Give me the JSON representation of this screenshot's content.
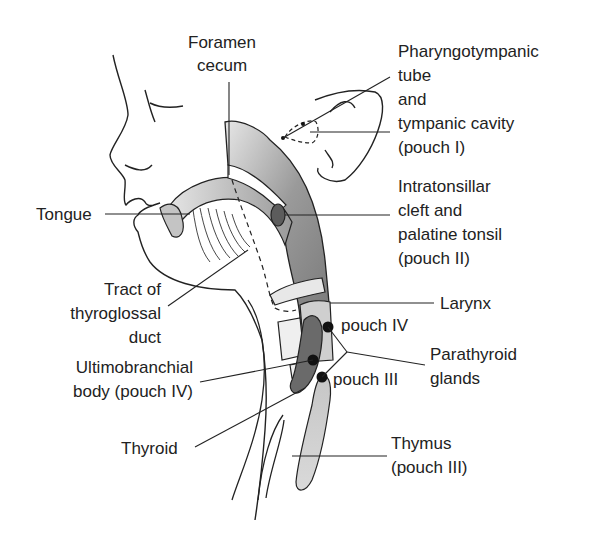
{
  "figure": {
    "colors": {
      "line": "#222222",
      "fill_light": "#d9d9d9",
      "fill_mid": "#a8a8a8",
      "fill_dark": "#6e6e6e",
      "gland_dot": "#111111",
      "background": "#ffffff"
    }
  },
  "labels": {
    "foramen_cecum": [
      "Foramen",
      "cecum"
    ],
    "pharyngotympanic": [
      "Pharyngotympanic",
      "tube",
      "and",
      "tympanic cavity",
      "(pouch I)"
    ],
    "tongue": "Tongue",
    "intratonsillar": [
      "Intratonsillar",
      "cleft and",
      "palatine tonsil",
      "(pouch II)"
    ],
    "tract": [
      "Tract of",
      "thyroglossal",
      "duct"
    ],
    "larynx": "Larynx",
    "pouch_iv": "pouch IV",
    "parathyroid": [
      "Parathyroid",
      "glands"
    ],
    "pouch_iii": "pouch III",
    "ultimobranchial": [
      "Ultimobranchial",
      "body (pouch IV)"
    ],
    "thyroid": "Thyroid",
    "thymus": [
      "Thymus",
      "(pouch III)"
    ]
  }
}
